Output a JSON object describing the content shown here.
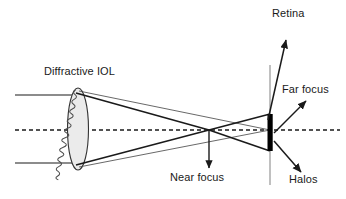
{
  "figure": {
    "kind": "optical-ray-diagram",
    "width_px": 346,
    "height_px": 199,
    "background_color": "#ffffff"
  },
  "labels": {
    "lens": "Diffractive IOL",
    "retina": "Retina",
    "far_focus": "Far focus",
    "halos": "Halos",
    "near_focus": "Near focus"
  },
  "colors": {
    "stroke": "#1a1a1a",
    "thin_ray": "#4d4d4d",
    "lens_fill": "#ebebeb",
    "lens_stroke": "#333333",
    "retina_plane": "#8c8c8c",
    "retina_bar": "#000000",
    "axis": "#1a1a1a",
    "text": "#1a1a1a"
  },
  "geometry": {
    "optical_axis_y": 130,
    "lens": {
      "cx": 78,
      "cy": 129,
      "rx": 10,
      "ry": 41,
      "rings": 13
    },
    "incoming_rays_y": [
      95,
      163
    ],
    "incoming_ray_start_x": 15,
    "near_focus_point": {
      "x": 209,
      "y": 130
    },
    "retina_plane_x": 270,
    "retina_plane_y_range": [
      65,
      185
    ],
    "retina_bar": {
      "x": 268,
      "y_top": 114,
      "y_bottom": 151,
      "width": 5
    }
  },
  "annotations": [
    {
      "name": "retina-arrow",
      "from": {
        "x": 270,
        "y": 120
      },
      "to": {
        "x": 285,
        "y": 38
      }
    },
    {
      "name": "far-focus-arrow",
      "from": {
        "x": 273,
        "y": 133
      },
      "to": {
        "x": 305,
        "y": 100
      }
    },
    {
      "name": "halos-arrow",
      "from": {
        "x": 273,
        "y": 140
      },
      "to": {
        "x": 300,
        "y": 172
      }
    },
    {
      "name": "near-focus-arrow",
      "from": {
        "x": 209,
        "y": 130
      },
      "to": {
        "x": 209,
        "y": 168
      }
    }
  ]
}
